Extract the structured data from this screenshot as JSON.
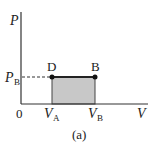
{
  "diagram": {
    "type": "pv-diagram",
    "caption": "(a)",
    "axes": {
      "y_label": "P",
      "x_label": "V",
      "origin_label": "0"
    },
    "ticks": {
      "y": [
        {
          "main": "P",
          "sub": "B"
        }
      ],
      "x": [
        {
          "main": "V",
          "sub": "A"
        },
        {
          "main": "V",
          "sub": "B"
        }
      ]
    },
    "points": [
      {
        "label": "D",
        "at": "(V_A, P_B)"
      },
      {
        "label": "B",
        "at": "(V_B, P_B)"
      }
    ],
    "shaded_region": "rectangle from V_A to V_B under P_B",
    "colors": {
      "axis": "#333333",
      "fill": "#c8c8c8",
      "line": "#222222"
    }
  }
}
